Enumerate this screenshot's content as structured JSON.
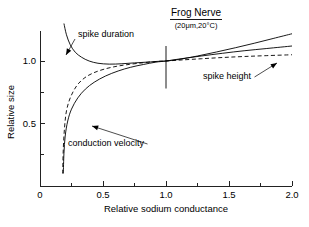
{
  "chart_data": {
    "type": "line",
    "title": "Frog Nerve",
    "subtitle": "(20μm,20°C)",
    "xlabel": "Relative sodium conductance",
    "ylabel": "Relative size",
    "xlim": [
      0,
      2.0
    ],
    "ylim": [
      0,
      1.24
    ],
    "grid": false,
    "legend_position": "inline-annotations",
    "xticks": [
      0,
      0.5,
      1.0,
      1.5,
      2.0
    ],
    "xtick_labels": [
      "0",
      "0.5",
      "1.0",
      "1.5",
      "2.0"
    ],
    "xminor_ticks": [
      0.25,
      0.75,
      1.25,
      1.75
    ],
    "yticks": [
      0,
      0.5,
      1.0
    ],
    "ytick_labels": [
      "",
      "0.5",
      "1.0"
    ],
    "yminor_ticks": [
      0.25,
      0.75
    ],
    "reference_line": {
      "x": 1.0,
      "y_from": 0.78,
      "y_to": 1.12
    },
    "normalization_point": {
      "x": 1.0,
      "y": 1.0
    },
    "series": [
      {
        "name": "spike duration",
        "style": "solid",
        "x": [
          0.19,
          0.21,
          0.24,
          0.28,
          0.33,
          0.39,
          0.46,
          0.55,
          0.65,
          0.75,
          0.85,
          0.95,
          1.0,
          1.1,
          1.25,
          1.4,
          1.55,
          1.7,
          1.85,
          2.0
        ],
        "y": [
          1.3,
          1.21,
          1.13,
          1.07,
          1.03,
          1.0,
          0.982,
          0.975,
          0.978,
          0.985,
          0.991,
          0.998,
          1.0,
          1.012,
          1.04,
          1.072,
          1.106,
          1.142,
          1.18,
          1.218
        ]
      },
      {
        "name": "conduction velocity",
        "style": "solid",
        "x": [
          0.185,
          0.19,
          0.2,
          0.22,
          0.25,
          0.3,
          0.36,
          0.43,
          0.52,
          0.62,
          0.72,
          0.82,
          0.92,
          1.0,
          1.12,
          1.28,
          1.45,
          1.62,
          1.8,
          2.0
        ],
        "y": [
          0.1,
          0.26,
          0.4,
          0.52,
          0.615,
          0.705,
          0.775,
          0.83,
          0.88,
          0.92,
          0.95,
          0.972,
          0.991,
          1.0,
          1.018,
          1.04,
          1.062,
          1.082,
          1.1,
          1.12
        ]
      },
      {
        "name": "spike height",
        "style": "dashed",
        "x": [
          0.18,
          0.185,
          0.195,
          0.21,
          0.24,
          0.29,
          0.35,
          0.42,
          0.51,
          0.61,
          0.71,
          0.82,
          0.92,
          1.0,
          1.12,
          1.28,
          1.45,
          1.62,
          1.8,
          2.0
        ],
        "y": [
          0.1,
          0.3,
          0.47,
          0.6,
          0.705,
          0.8,
          0.862,
          0.903,
          0.935,
          0.958,
          0.973,
          0.986,
          0.996,
          1.0,
          1.008,
          1.018,
          1.028,
          1.036,
          1.043,
          1.05
        ]
      }
    ],
    "annotations": [
      {
        "label": "spike duration",
        "x_px": 78,
        "y_px": 37,
        "target_x_px": 66,
        "target_y_px": 55
      },
      {
        "label": "conduction velocity",
        "x_px": 68,
        "y_px": 146,
        "target_x_px": 92,
        "target_y_px": 126
      },
      {
        "label": "spike height",
        "x_px": 203,
        "y_px": 79,
        "target_x_px": 277,
        "target_y_px": 63
      }
    ]
  },
  "figure": {
    "title": "Frog Nerve",
    "subtitle": "(20μm,20°C)",
    "x_axis_title": "Relative sodium conductance",
    "y_axis_title": "Relative size",
    "x_tick_0": "0",
    "x_tick_1": "0.5",
    "x_tick_2": "1.0",
    "x_tick_3": "1.5",
    "x_tick_4": "2.0",
    "y_tick_05": "0.5",
    "y_tick_10": "1.0",
    "label_spike_duration": "spike duration",
    "label_conduction_velocity": "conduction velocity",
    "label_spike_height": "spike height"
  }
}
